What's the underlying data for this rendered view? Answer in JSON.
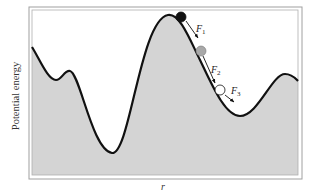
{
  "diagram": {
    "type": "potential-energy-landscape",
    "axes": {
      "ylabel": "Potential energy",
      "xlabel": "r"
    },
    "colors": {
      "fill": "#d4d4d4",
      "curve": "#111111",
      "frame": "#9a9a9a",
      "ball_1": "#111111",
      "ball_2": "#a8a8a8",
      "ball_3": "#ffffff"
    },
    "balls": [
      {
        "id": 1,
        "shade": "black",
        "force_label": "F",
        "subscript": "1"
      },
      {
        "id": 2,
        "shade": "gray",
        "force_label": "F",
        "subscript": "2"
      },
      {
        "id": 3,
        "shade": "white",
        "force_label": "F",
        "subscript": "3"
      }
    ]
  }
}
